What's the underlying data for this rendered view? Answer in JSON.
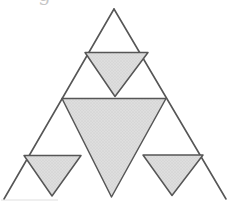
{
  "figure": {
    "canvas": {
      "width": 232,
      "height": 201,
      "background": "#ffffff"
    },
    "colors": {
      "stroke": "#565656",
      "fill_base": "#dedede",
      "fill_dot": "#c6c6c6",
      "artifact": "#b9b9b9"
    },
    "stroke_width": 1.6,
    "outer_triangle": {
      "name": "outer-triangle",
      "apex": [
        114,
        9
      ],
      "bottom_left": [
        4,
        199
      ],
      "bottom_right": [
        226,
        199
      ],
      "bottom_edge_visible": false
    },
    "shaded_triangles": [
      {
        "name": "top-small-inverted-triangle",
        "points": [
          [
            85,
            52.5
          ],
          [
            148,
            52.5
          ],
          [
            115,
            96.5
          ]
        ]
      },
      {
        "name": "center-large-inverted-triangle",
        "points": [
          [
            62,
            98.5
          ],
          [
            166,
            98.5
          ],
          [
            111.5,
            197
          ]
        ]
      },
      {
        "name": "bottom-left-inverted-triangle",
        "points": [
          [
            24,
            155.5
          ],
          [
            81,
            155.5
          ],
          [
            52,
            196
          ]
        ]
      },
      {
        "name": "bottom-right-inverted-triangle",
        "points": [
          [
            143,
            155
          ],
          [
            203,
            155
          ],
          [
            172,
            195.5
          ]
        ]
      }
    ],
    "artifacts": {
      "cropped_text_fragment": {
        "char": "g",
        "x": 38,
        "baseline_y": 1,
        "font_size": 20
      },
      "bottom_edge_smudge": {
        "x1": 1,
        "y1": 200,
        "x2": 58,
        "y2": 200,
        "opacity": 0.45
      }
    }
  }
}
